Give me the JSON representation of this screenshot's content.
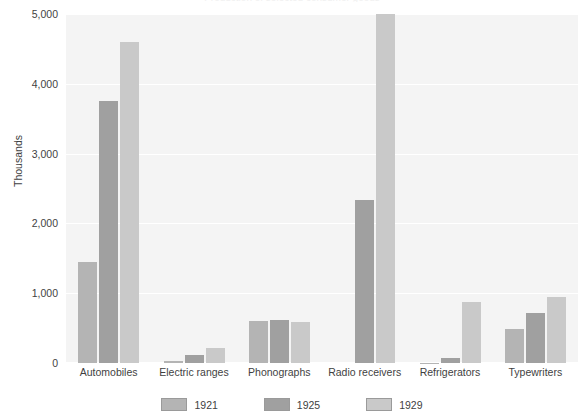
{
  "chart_data": {
    "type": "bar",
    "title": "Production of selected consumer goods",
    "categories": [
      "Automobiles",
      "Electric ranges",
      "Phonographs",
      "Radio receivers",
      "Refrigerators",
      "Typewriters"
    ],
    "series": [
      {
        "name": "1921",
        "color": "#b4b4b4",
        "values": [
          1450,
          30,
          595,
          0,
          5,
          490
        ]
      },
      {
        "name": "1925",
        "color": "#a0a0a0",
        "values": [
          3750,
          110,
          620,
          2340,
          75,
          720
        ]
      },
      {
        "name": "1929",
        "color": "#c9c9c9",
        "values": [
          4600,
          215,
          590,
          5000,
          880,
          950
        ]
      }
    ],
    "xlabel": "",
    "ylabel": "Thousands",
    "ylim": [
      0,
      5000
    ],
    "yticks": [
      0,
      1000,
      2000,
      3000,
      4000,
      5000
    ],
    "ytick_labels": [
      "0",
      "1,000",
      "2,000",
      "3,000",
      "4,000",
      "5,000"
    ],
    "grid": true,
    "legend_position": "bottom",
    "plot_background": "#f4f4f4",
    "gridline_color": "#ffffff"
  }
}
